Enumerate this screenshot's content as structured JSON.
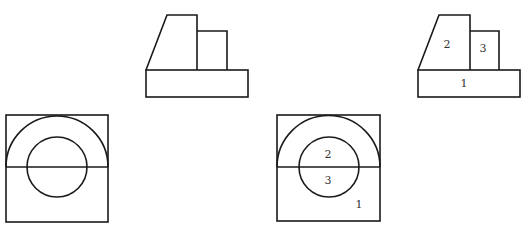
{
  "diagram": {
    "views": [
      {
        "id": "front-view-unlabeled",
        "labels": []
      },
      {
        "id": "front-view-labeled",
        "labels": [
          {
            "text": "2",
            "x": 447,
            "y": 45
          },
          {
            "text": "3",
            "x": 483,
            "y": 49
          },
          {
            "text": "1",
            "x": 464,
            "y": 84
          }
        ]
      },
      {
        "id": "top-view-unlabeled",
        "labels": []
      },
      {
        "id": "top-view-labeled",
        "labels": [
          {
            "text": "2",
            "x": 328,
            "y": 155
          },
          {
            "text": "3",
            "x": 328,
            "y": 181
          },
          {
            "text": "1",
            "x": 359,
            "y": 205
          }
        ]
      }
    ],
    "colors": {
      "line": "#1a1a1a",
      "label": "#333333",
      "background": "#ffffff"
    }
  }
}
